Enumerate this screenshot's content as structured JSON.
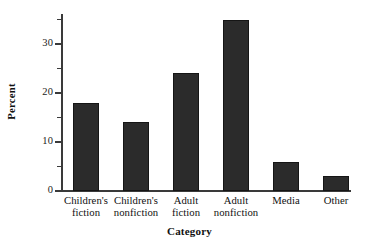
{
  "chart_data": {
    "type": "bar",
    "title": "",
    "subtitle": "",
    "xlabel": "Category",
    "ylabel": "Percent",
    "categories": [
      "Children's fiction",
      "Children's nonfiction",
      "Adult fiction",
      "Adult nonfiction",
      "Media",
      "Other"
    ],
    "category_lines": [
      [
        "Children's",
        "fiction"
      ],
      [
        "Children's",
        "nonfiction"
      ],
      [
        "Adult",
        "fiction"
      ],
      [
        "Adult",
        "nonfiction"
      ],
      [
        "Media",
        ""
      ],
      [
        "Other",
        ""
      ]
    ],
    "values": [
      18,
      14,
      24,
      35,
      6,
      3
    ],
    "ylim": [
      0,
      36
    ],
    "xlim_note": "categorical",
    "y_major_ticks": [
      0,
      10,
      20,
      30
    ],
    "y_major_tick_labels": [
      "0",
      "10",
      "20",
      "30"
    ],
    "y_minor_ticks": [
      5,
      15,
      25,
      35
    ],
    "grid": false,
    "legend": false,
    "legend_position": "none",
    "bar_color": "#2b2b2b",
    "axis_color": "#3a3a3a",
    "background_color": "#ffffff"
  }
}
